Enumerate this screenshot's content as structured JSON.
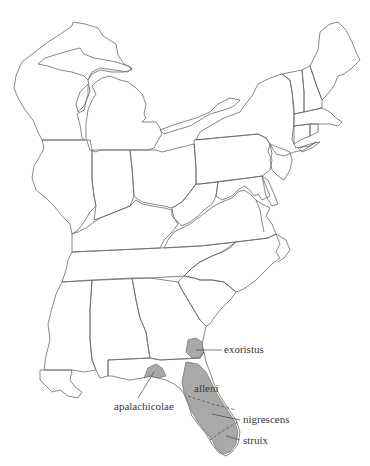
{
  "map": {
    "region": "Eastern United States",
    "style": "outline map with shaded range",
    "range_fill_color": "#a9a9a9",
    "outline_color": "#6a6a6a",
    "labels": [
      {
        "id": "exoristus",
        "text": "exoristus"
      },
      {
        "id": "alleni",
        "text": "alleni"
      },
      {
        "id": "apalachicolae",
        "text": "apalachicolae"
      },
      {
        "id": "nigrescens",
        "text": "nigrescens"
      },
      {
        "id": "struix",
        "text": "struix"
      }
    ]
  }
}
